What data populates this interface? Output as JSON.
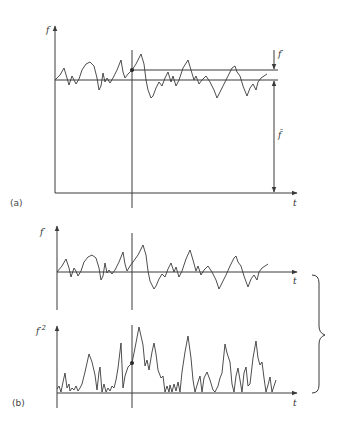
{
  "figure": {
    "part_a": {
      "label": "(a)",
      "y_axis_label": "f",
      "x_axis_label": "t",
      "fluctuation_label": "f′",
      "mean_label": "f̄",
      "annotations": [
        "f′ marked as the difference between the instantaneous value and the mean",
        "f̄ marked as the height of the mean line above the t-axis"
      ]
    },
    "part_b": {
      "label": "(b)",
      "upper_plot": {
        "y_axis_label": "f′",
        "x_axis_label": "t"
      },
      "lower_plot": {
        "y_axis_label": "f′",
        "y_axis_superscript": "2",
        "x_axis_label": "t"
      },
      "brace": "right curly brace spanning both plots"
    },
    "colors": {
      "line": "#3a3a3a",
      "background": "#ffffff"
    }
  }
}
